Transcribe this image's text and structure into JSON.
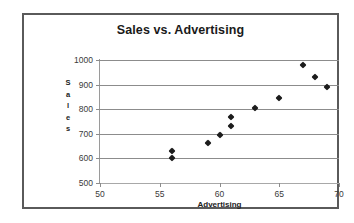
{
  "chart_data": {
    "type": "scatter",
    "title": "Sales vs. Advertising",
    "xlabel": "Advertising",
    "ylabel": "Sales",
    "xlim": [
      50,
      70
    ],
    "ylim": [
      500,
      1000
    ],
    "xticks": [
      50,
      55,
      60,
      65,
      70
    ],
    "yticks": [
      500,
      600,
      700,
      800,
      900,
      1000
    ],
    "grid": "horizontal",
    "legend": "none",
    "marker": "diamond",
    "marker_color": "#1c1c1c",
    "series": [
      {
        "name": "Sales",
        "points": [
          {
            "x": 56,
            "y": 600
          },
          {
            "x": 56,
            "y": 630
          },
          {
            "x": 59,
            "y": 663
          },
          {
            "x": 60,
            "y": 697
          },
          {
            "x": 61,
            "y": 730
          },
          {
            "x": 61,
            "y": 767
          },
          {
            "x": 63,
            "y": 805
          },
          {
            "x": 65,
            "y": 845
          },
          {
            "x": 67,
            "y": 978
          },
          {
            "x": 68,
            "y": 930
          },
          {
            "x": 69,
            "y": 890
          }
        ]
      }
    ]
  },
  "axes": {
    "y_title_letters": [
      "S",
      "a",
      "l",
      "e",
      "s"
    ],
    "x_tick_labels": [
      "50",
      "55",
      "60",
      "65",
      "70"
    ],
    "y_tick_labels": [
      "1000",
      "900",
      "800",
      "700",
      "600",
      "500"
    ]
  },
  "colors": {
    "frame": "#5a5a5a",
    "gridline": "#8c8c8c",
    "axis": "#9a9a9a",
    "text": "#1a1a1a",
    "marker": "#1c1c1c",
    "background": "#ffffff"
  }
}
